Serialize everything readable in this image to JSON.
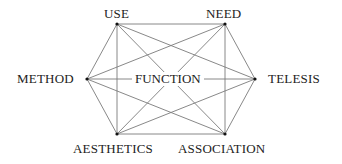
{
  "diagram": {
    "center": {
      "label": "FUNCTION"
    },
    "nodes": [
      {
        "id": "use",
        "label": "USE",
        "x": 117,
        "y": 24
      },
      {
        "id": "need",
        "label": "NEED",
        "x": 225,
        "y": 24
      },
      {
        "id": "method",
        "label": "METHOD",
        "x": 87,
        "y": 79
      },
      {
        "id": "telesis",
        "label": "TELESIS",
        "x": 255,
        "y": 79
      },
      {
        "id": "aesthetics",
        "label": "AESTHETICS",
        "x": 117,
        "y": 134
      },
      {
        "id": "association",
        "label": "ASSOCIATION",
        "x": 225,
        "y": 134
      }
    ],
    "edges": [
      [
        "use",
        "need"
      ],
      [
        "use",
        "method"
      ],
      [
        "use",
        "telesis"
      ],
      [
        "use",
        "aesthetics"
      ],
      [
        "use",
        "association"
      ],
      [
        "need",
        "method"
      ],
      [
        "need",
        "telesis"
      ],
      [
        "need",
        "aesthetics"
      ],
      [
        "need",
        "association"
      ],
      [
        "method",
        "telesis"
      ],
      [
        "method",
        "aesthetics"
      ],
      [
        "method",
        "association"
      ],
      [
        "telesis",
        "aesthetics"
      ],
      [
        "telesis",
        "association"
      ],
      [
        "aesthetics",
        "association"
      ]
    ],
    "colors": {
      "line": "#7a7a7a",
      "node": "#111111",
      "text": "#222222"
    }
  }
}
